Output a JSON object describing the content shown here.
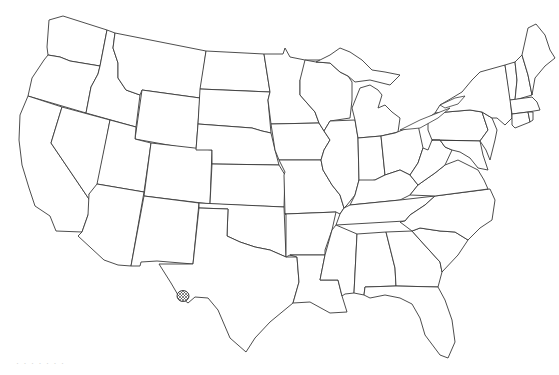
{
  "map": {
    "title": "Outline map of the contiguous United States",
    "region": "Contiguous United States",
    "style": "black state outlines on white background",
    "line_color": "#3a3a3a",
    "background_color": "#ffffff",
    "marker": {
      "description": "Small cross-hatched circular region on the Texas–Mexico border (Big Bend area, West Texas)",
      "pattern": "cross-hatch",
      "color": "#333333"
    },
    "states_drawn": [
      "WA",
      "OR",
      "CA",
      "ID",
      "NV",
      "MT",
      "WY",
      "UT",
      "AZ",
      "CO",
      "NM",
      "ND",
      "SD",
      "NE",
      "KS",
      "OK",
      "TX",
      "MN",
      "IA",
      "MO",
      "AR",
      "LA",
      "WI",
      "IL",
      "MI",
      "IN",
      "OH",
      "KY",
      "TN",
      "MS",
      "AL",
      "GA",
      "FL",
      "SC",
      "NC",
      "VA",
      "WV",
      "PA",
      "NY",
      "MD",
      "DE",
      "NJ",
      "CT",
      "RI",
      "MA",
      "VT",
      "NH",
      "ME"
    ],
    "caption": "· · · · · · ·"
  }
}
